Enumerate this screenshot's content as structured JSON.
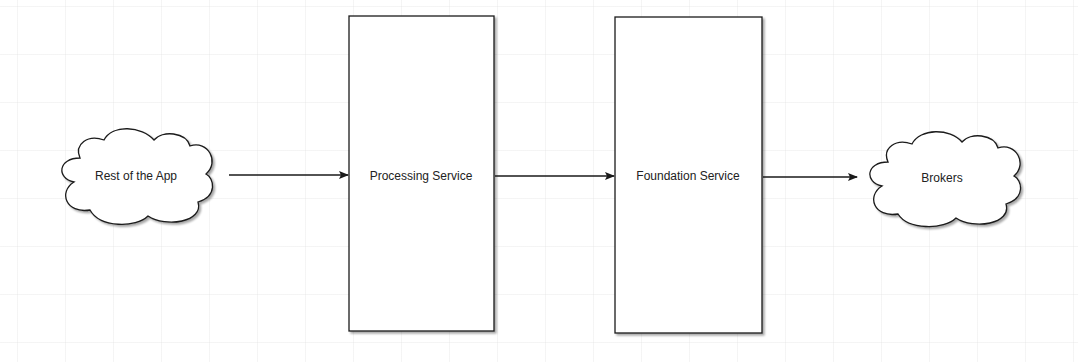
{
  "diagram": {
    "type": "flow",
    "colors": {
      "stroke": "#1a1a1a",
      "shadow": "#9a9a9a",
      "fill": "#ffffff",
      "text": "#222222",
      "grid": "#e6e6e6"
    },
    "nodes": [
      {
        "id": "rest-of-app",
        "shape": "cloud",
        "label": "Rest of the App"
      },
      {
        "id": "processing-service",
        "shape": "rectangle",
        "label": "Processing Service"
      },
      {
        "id": "foundation-service",
        "shape": "rectangle",
        "label": "Foundation Service"
      },
      {
        "id": "brokers",
        "shape": "cloud",
        "label": "Brokers"
      }
    ],
    "edges": [
      {
        "from": "rest-of-app",
        "to": "processing-service",
        "label": ""
      },
      {
        "from": "processing-service",
        "to": "foundation-service",
        "label": ""
      },
      {
        "from": "foundation-service",
        "to": "brokers",
        "label": ""
      }
    ]
  }
}
